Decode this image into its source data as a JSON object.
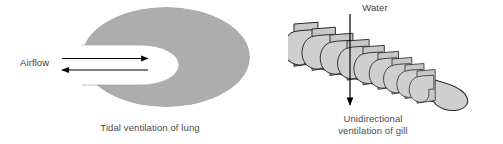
{
  "figure": {
    "background_color": "#ffffff",
    "width": 503,
    "height": 144
  },
  "panels": {
    "lung": {
      "caption": "Tidal ventilation of lung",
      "flow_label": "Airflow",
      "flow_direction": "bidirectional",
      "arrow_in_direction": "right",
      "arrow_out_direction": "left",
      "body_fill": "#ADADAD",
      "body_stroke": "#7a7a7a",
      "cavity_fill": "#ffffff",
      "arrow_color": "#000000",
      "shape": "ellipse-with-central-cavity"
    },
    "gill": {
      "caption_line1": "Unidirectional",
      "caption_line2": "ventilation of gill",
      "flow_label": "Water",
      "flow_direction": "unidirectional",
      "arrow_direction": "down",
      "lamella_fill": "#CFCFCF",
      "lamella_stroke": "#2b2b2b",
      "plate_fill": "#C8C8C8",
      "arrow_color": "#000000",
      "lamella_count": 9,
      "shape": "stacked-angled-lamellae"
    }
  },
  "colors": {
    "ink": "#000000",
    "text": "#4a4a4a",
    "mid_gray": "#ADADAD",
    "light_gray": "#CFCFCF",
    "outline": "#2b2b2b",
    "white": "#ffffff"
  }
}
